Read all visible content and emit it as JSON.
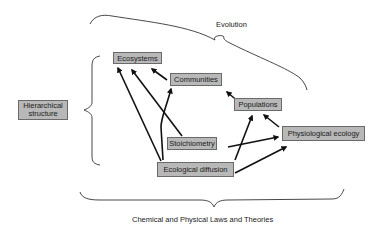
{
  "diagram": {
    "top_brace_label": "Evolution",
    "bottom_brace_label": "Chemical and Physical Laws and Theories",
    "side_box_label": "Hierarchical structure",
    "nodes": {
      "ecosystems": "Ecosystems",
      "communities": "Communities",
      "populations": "Populations",
      "physiological_ecology": "Physiological ecology",
      "stoichiometry": "Stoichiometry",
      "ecological_diffusion": "Ecological diffusion"
    },
    "edges": [
      {
        "from": "Ecological diffusion",
        "to": "Ecosystems"
      },
      {
        "from": "Stoichiometry",
        "to": "Ecosystems"
      },
      {
        "from": "Communities",
        "to": "Ecosystems"
      },
      {
        "from": "Ecological diffusion",
        "to": "Communities"
      },
      {
        "from": "Populations",
        "to": "Communities"
      },
      {
        "from": "Stoichiometry",
        "to": "Physiological ecology"
      },
      {
        "from": "Ecological diffusion",
        "to": "Populations"
      },
      {
        "from": "Ecological diffusion",
        "to": "Physiological ecology"
      },
      {
        "from": "Physiological ecology",
        "to": "Populations"
      }
    ],
    "colors": {
      "box_fill": "#b8b8b8",
      "box_border": "#6a6a6a",
      "arrow": "#111111",
      "brace": "#333333",
      "background": "#ffffff"
    }
  }
}
